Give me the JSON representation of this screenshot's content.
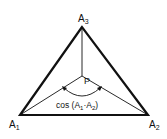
{
  "diagram": {
    "vertices": {
      "a1": {
        "label": "A",
        "sub": "1"
      },
      "a2": {
        "label": "A",
        "sub": "2"
      },
      "a3": {
        "label": "A",
        "sub": "3"
      }
    },
    "center": {
      "label": "P"
    },
    "angle_label": {
      "prefix": "cos (A",
      "sub1": "1",
      "mid": "·A",
      "sub2": "2",
      "suffix": ")"
    }
  }
}
